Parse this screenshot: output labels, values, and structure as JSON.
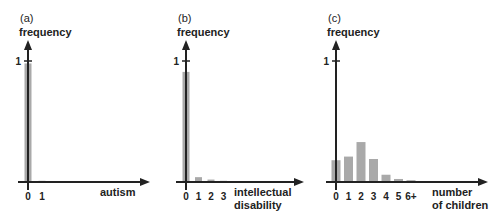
{
  "colors": {
    "bar": "#a9a9a9",
    "axis": "#222222"
  },
  "chart_data": [
    {
      "type": "bar",
      "panel": "(a)",
      "title": "",
      "ylabel": "frequency",
      "xlabel": "autism",
      "categories": [
        "0",
        "1"
      ],
      "values": [
        0.98,
        0.01
      ],
      "yticks": [
        "1"
      ],
      "ylim": [
        0,
        1.15
      ]
    },
    {
      "type": "bar",
      "panel": "(b)",
      "title": "",
      "ylabel": "frequency",
      "xlabel": "intellectual disability",
      "xlabel_lines": [
        "intellectual",
        "disability"
      ],
      "categories": [
        "0",
        "1",
        "2",
        "3"
      ],
      "values": [
        0.91,
        0.04,
        0.02,
        0.01
      ],
      "yticks": [
        "1"
      ],
      "ylim": [
        0,
        1.15
      ]
    },
    {
      "type": "bar",
      "panel": "(c)",
      "title": "",
      "ylabel": "frequency",
      "xlabel": "number of children",
      "xlabel_lines": [
        "number",
        "of children"
      ],
      "categories": [
        "0",
        "1",
        "2",
        "3",
        "4",
        "5",
        "6+"
      ],
      "values": [
        0.18,
        0.21,
        0.33,
        0.19,
        0.06,
        0.025,
        0.015
      ],
      "yticks": [
        "1"
      ],
      "ylim": [
        0,
        1.15
      ]
    }
  ]
}
